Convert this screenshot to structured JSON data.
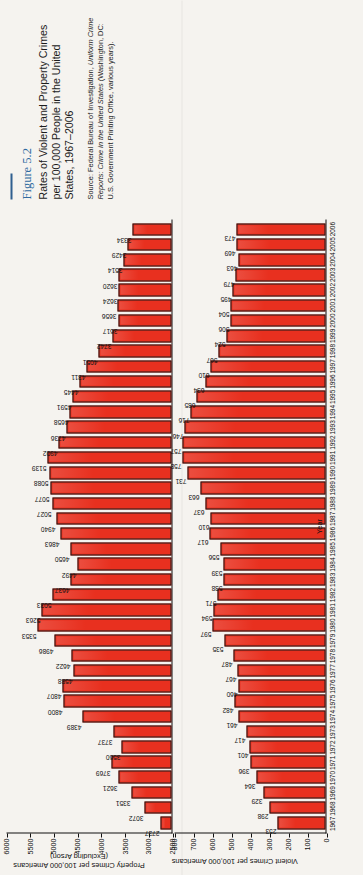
{
  "figure": {
    "number": "Figure 5.2",
    "title": "Rates of Violent and Property Crimes per 100,000 People in the United States, 1967–2006",
    "source_prefix": "Source: Federal Bureau of Investigation, ",
    "source_italic": "Uniform Crime Reports: Crime in the United States",
    "source_suffix": " (Washington, DC: U.S. Government Printing Office, various years)."
  },
  "chart_data": [
    {
      "type": "bar",
      "name": "property-crimes",
      "title": "Property Crimes per 100,000 Americans (Excluding Arson)",
      "ylabel": "Property Crimes per 100,000 Americans (Excluding Arson)",
      "xlabel": "Year",
      "ylim": [
        2500,
        6000
      ],
      "yticks": [
        6000,
        5500,
        5000,
        4500,
        4000,
        3500,
        3000,
        2500
      ],
      "grid": false,
      "legend": "none",
      "categories": [
        1967,
        1968,
        1969,
        1970,
        1971,
        1972,
        1973,
        1974,
        1975,
        1976,
        1977,
        1978,
        1979,
        1980,
        1981,
        1982,
        1983,
        1984,
        1985,
        1986,
        1987,
        1988,
        1989,
        1990,
        1991,
        1992,
        1993,
        1994,
        1995,
        1996,
        1997,
        1998,
        1999,
        2000,
        2001,
        2002,
        2003,
        2004,
        2005,
        2006
      ],
      "values": [
        2737,
        3072,
        3351,
        3621,
        3769,
        3560,
        3737,
        4389,
        4800,
        4807,
        4588,
        4622,
        4986,
        5353,
        5263,
        5033,
        4637,
        4492,
        4650,
        4863,
        4940,
        5027,
        5077,
        5088,
        5139,
        4902,
        4736,
        4658,
        4591,
        4445,
        4311,
        4051,
        3742,
        3617,
        3656,
        3624,
        3620,
        3514,
        3429,
        3334
      ]
    },
    {
      "type": "bar",
      "name": "violent-crimes",
      "title": "Violent Crimes per 100,000 Americans",
      "ylabel": "Violent Crimes per 100,000 Americans",
      "xlabel": "Year",
      "ylim": [
        0,
        800
      ],
      "yticks": [
        800,
        700,
        600,
        500,
        400,
        300,
        200,
        100,
        0
      ],
      "grid": false,
      "legend": "none",
      "categories": [
        1967,
        1968,
        1969,
        1970,
        1971,
        1972,
        1973,
        1974,
        1975,
        1976,
        1977,
        1978,
        1979,
        1980,
        1981,
        1982,
        1983,
        1984,
        1985,
        1986,
        1987,
        1988,
        1989,
        1990,
        1991,
        1992,
        1993,
        1994,
        1995,
        1996,
        1997,
        1998,
        1999,
        2000,
        2001,
        2002,
        2003,
        2004,
        2005,
        2006
      ],
      "values": [
        253,
        298,
        329,
        364,
        396,
        401,
        417,
        461,
        482,
        460,
        467,
        487,
        535,
        597,
        594,
        571,
        538,
        539,
        556,
        617,
        610,
        637,
        663,
        731,
        758,
        757,
        746,
        716,
        685,
        634,
        610,
        567,
        524,
        506,
        504,
        495,
        479,
        463,
        469,
        473
      ]
    }
  ],
  "colors": {
    "bar_fill": "#e8301f",
    "bar_stroke": "#1a1a1a",
    "caption_accent": "#2f6aa0",
    "page_background": "#f5f3ef"
  }
}
